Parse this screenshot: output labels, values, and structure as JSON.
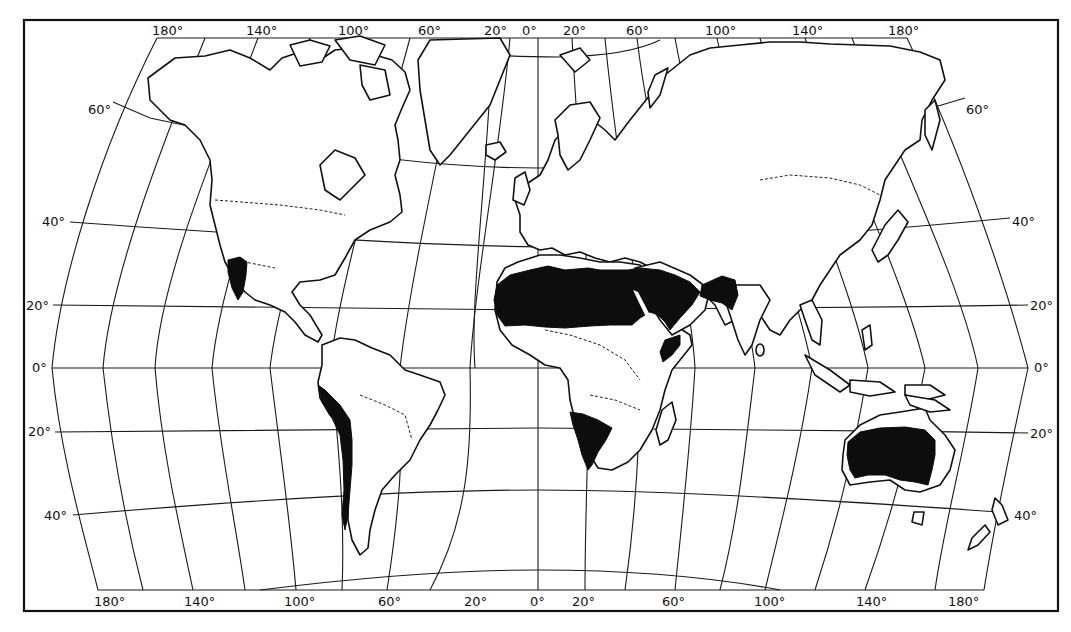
{
  "map": {
    "title": "World distribution of desert regions",
    "colors": {
      "land": "#ffffff",
      "desert": "#0d0d0d",
      "lines": "#111111",
      "background": "#ffffff"
    },
    "top_longitude_labels": [
      "180°",
      "140°",
      "100°",
      "60°",
      "20°",
      "0°",
      "20°",
      "60°",
      "100°",
      "140°",
      "180°"
    ],
    "bottom_longitude_labels": [
      "180°",
      "140°",
      "100°",
      "60°",
      "20°",
      "0°",
      "20°",
      "60°",
      "100°",
      "140°",
      "180°"
    ],
    "left_latitude_labels": [
      "60°",
      "40°",
      "20°",
      "0°",
      "20°",
      "40°"
    ],
    "right_latitude_labels": [
      "60°",
      "40°",
      "20°",
      "0°",
      "20°",
      "40°"
    ],
    "desert_regions": [
      "North American (Sonoran/Mojave) desert",
      "Atacama / Peruvian coastal desert",
      "Sahara desert",
      "Arabian desert",
      "Thar / Iranian desert",
      "Somali (Horn of Africa) desert",
      "Namib / Kalahari desert",
      "Australian interior desert"
    ]
  }
}
